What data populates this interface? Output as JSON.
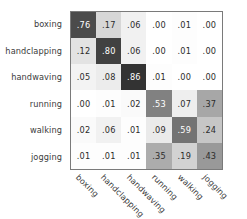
{
  "chart_data": {
    "type": "heatmap",
    "title": "",
    "subtitle": "",
    "xlabel": "",
    "ylabel": "",
    "grid": false,
    "legend": "none",
    "colormap": "grayscale-inverted",
    "value_range": [
      0.0,
      1.0
    ],
    "categories": [
      "boxing",
      "handclapping",
      "handwaving",
      "running",
      "walking",
      "jogging"
    ],
    "row_labels": [
      "boxing",
      "handclapping",
      "handwaving",
      "running",
      "walking",
      "jogging"
    ],
    "col_labels": [
      "boxing",
      "handclapping",
      "handwaving",
      "running",
      "walking",
      "jogging"
    ],
    "rows": [
      {
        "label": "boxing",
        "cells": [
          ".76",
          ".17",
          ".06",
          ".00",
          ".01",
          ".00"
        ],
        "values": [
          0.76,
          0.17,
          0.06,
          0.0,
          0.01,
          0.0
        ]
      },
      {
        "label": "handclapping",
        "cells": [
          ".12",
          ".80",
          ".06",
          ".00",
          ".01",
          ".00"
        ],
        "values": [
          0.12,
          0.8,
          0.06,
          0.0,
          0.01,
          0.0
        ]
      },
      {
        "label": "handwaving",
        "cells": [
          ".05",
          ".08",
          ".86",
          ".01",
          ".00",
          ".00"
        ],
        "values": [
          0.05,
          0.08,
          0.86,
          0.01,
          0.0,
          0.0
        ]
      },
      {
        "label": "running",
        "cells": [
          ".00",
          ".01",
          ".02",
          ".53",
          ".07",
          ".37"
        ],
        "values": [
          0.0,
          0.01,
          0.02,
          0.53,
          0.07,
          0.37
        ]
      },
      {
        "label": "walking",
        "cells": [
          ".02",
          ".06",
          ".01",
          ".09",
          ".59",
          ".24"
        ],
        "values": [
          0.02,
          0.06,
          0.01,
          0.09,
          0.59,
          0.24
        ]
      },
      {
        "label": "jogging",
        "cells": [
          ".01",
          ".01",
          ".01",
          ".35",
          ".19",
          ".43"
        ],
        "values": [
          0.01,
          0.01,
          0.01,
          0.35,
          0.19,
          0.43
        ]
      }
    ],
    "colors": {
      "background": "#ffffff",
      "border": "#7a7a7a",
      "label_text": "#3b3b3b",
      "dark_cell_text": "#ffffff",
      "light_cell_text": "#2b2b2b"
    }
  }
}
